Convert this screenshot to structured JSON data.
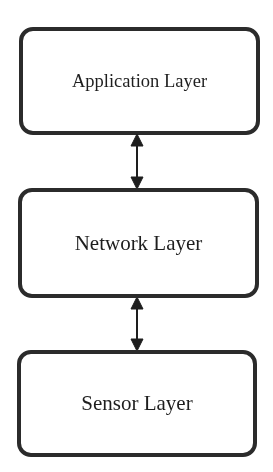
{
  "diagram": {
    "type": "layered-architecture",
    "layers": [
      {
        "label": "Application Layer"
      },
      {
        "label": "Network Layer"
      },
      {
        "label": "Sensor Layer"
      }
    ],
    "connections": [
      {
        "from": "Application Layer",
        "to": "Network Layer",
        "direction": "bidirectional"
      },
      {
        "from": "Network Layer",
        "to": "Sensor Layer",
        "direction": "bidirectional"
      }
    ],
    "colors": {
      "stroke": "#2b2b2b",
      "fill": "#ffffff",
      "text": "#1e1e1e"
    }
  }
}
